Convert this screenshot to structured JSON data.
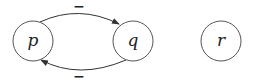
{
  "diagram": {
    "type": "directed-graph",
    "nodes": [
      {
        "id": "p",
        "label": "p",
        "cx": 33,
        "cy": 41,
        "r": 20
      },
      {
        "id": "q",
        "label": "q",
        "cx": 133,
        "cy": 41,
        "r": 20
      },
      {
        "id": "r",
        "label": "r",
        "cx": 221,
        "cy": 41,
        "r": 20
      }
    ],
    "edges": [
      {
        "from": "p",
        "to": "q",
        "label": "−",
        "position": "top"
      },
      {
        "from": "q",
        "to": "p",
        "label": "−",
        "position": "bottom"
      }
    ],
    "colors": {
      "stroke": "#555555",
      "text": "#222222",
      "background": "#ffffff"
    }
  }
}
